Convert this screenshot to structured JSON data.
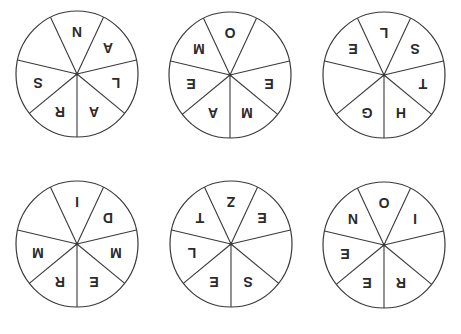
{
  "puzzle": {
    "description": "Six letter wheels, each divided into 7 segments; letters displayed rotated 180 degrees",
    "segment_order": [
      "top",
      "upper-right",
      "right",
      "lower-right",
      "lower-left",
      "left",
      "upper-left"
    ],
    "wheels": [
      {
        "id": 1,
        "center": [
          77,
          74
        ],
        "segments": [
          "N",
          "A",
          "L",
          "A",
          "R",
          "S",
          ""
        ]
      },
      {
        "id": 2,
        "center": [
          230,
          75
        ],
        "segments": [
          "O",
          "",
          "E",
          "M",
          "A",
          "E",
          "M"
        ]
      },
      {
        "id": 3,
        "center": [
          384,
          75
        ],
        "segments": [
          "L",
          "S",
          "T",
          "H",
          "G",
          "",
          "E"
        ]
      },
      {
        "id": 4,
        "center": [
          77,
          244
        ],
        "segments": [
          "I",
          "D",
          "M",
          "E",
          "R",
          "M",
          ""
        ]
      },
      {
        "id": 5,
        "center": [
          231,
          244
        ],
        "segments": [
          "Z",
          "E",
          "",
          "S",
          "E",
          "L",
          "T"
        ]
      },
      {
        "id": 6,
        "center": [
          384,
          245
        ],
        "segments": [
          "O",
          "I",
          "",
          "R",
          "E",
          "E",
          "N"
        ]
      }
    ]
  },
  "style": {
    "line_color": "#3a3a3a",
    "letter_color": "#2b2b2b",
    "background": "#ffffff"
  }
}
